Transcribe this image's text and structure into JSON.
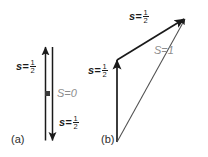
{
  "figure": {
    "background_color": "#ffffff",
    "vector_color": "#1a1a1a",
    "resultant_label_color": "#8d8d8d",
    "width": 208,
    "height": 157
  },
  "panels": [
    {
      "id": "a",
      "caption": "(a)",
      "total_spin": {
        "symbol": "S",
        "equals": "=",
        "value": "0",
        "text": "S = 0",
        "color": "#8d8d8d"
      },
      "vectors": [
        {
          "name": "spin-up",
          "symbol": "s",
          "equals": "=",
          "numerator": "1",
          "denominator": "2",
          "text": "s = 1/2",
          "direction": "up"
        },
        {
          "name": "spin-down",
          "symbol": "s",
          "equals": "=",
          "numerator": "1",
          "denominator": "2",
          "text": "s = 1/2",
          "direction": "down"
        }
      ]
    },
    {
      "id": "b",
      "caption": "(b)",
      "total_spin": {
        "symbol": "S",
        "equals": "=",
        "value": "1",
        "text": "S = 1",
        "color": "#8d8d8d"
      },
      "vectors": [
        {
          "name": "spin-first",
          "symbol": "s",
          "equals": "=",
          "numerator": "1",
          "denominator": "2",
          "text": "s = 1/2",
          "direction": "up"
        },
        {
          "name": "spin-second",
          "symbol": "s",
          "equals": "=",
          "numerator": "1",
          "denominator": "2",
          "text": "s = 1/2",
          "direction": "up-right"
        }
      ]
    }
  ]
}
